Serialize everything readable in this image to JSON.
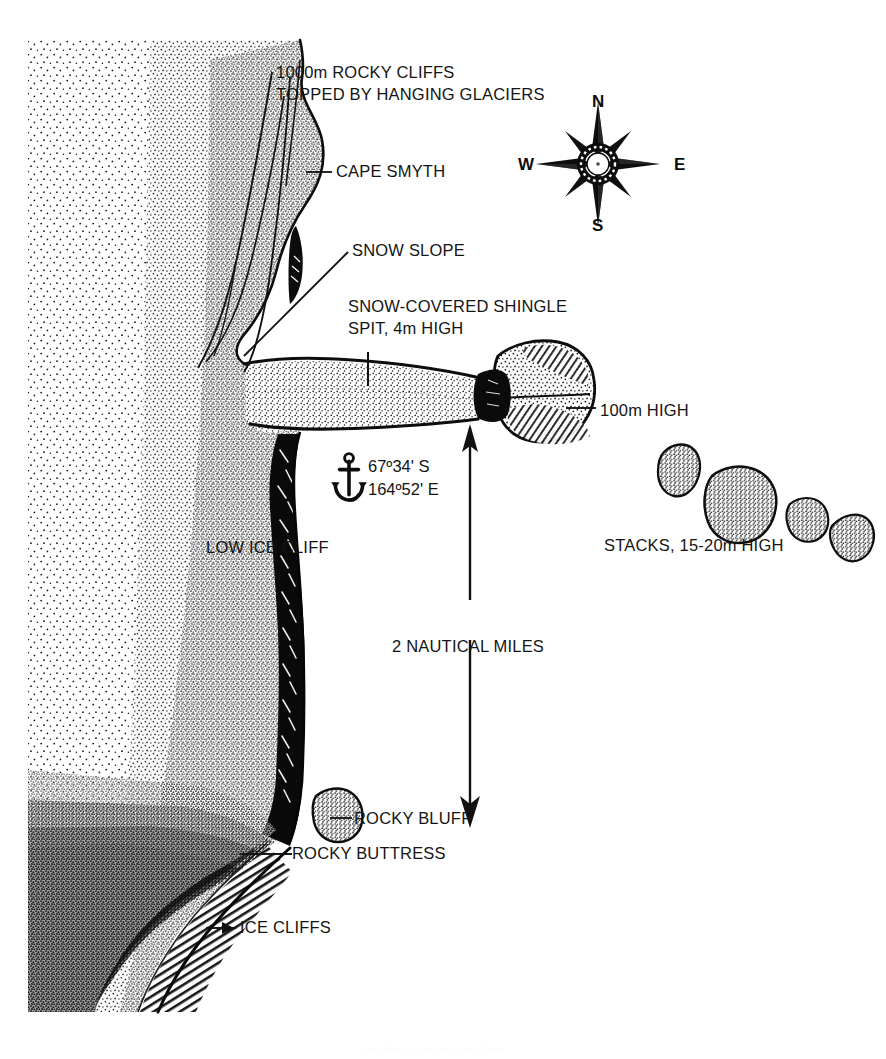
{
  "figure": {
    "type": "hand-drawn coastal profile map",
    "background_color": "#ffffff",
    "ink_color": "#111111"
  },
  "labels": {
    "cliffs_line1": "1000m ROCKY CLIFFS",
    "cliffs_line2": "TOPPED BY HANGING GLACIERS",
    "cape": "CAPE SMYTH",
    "snow_slope": "SNOW SLOPE",
    "spit_line1": "SNOW-COVERED SHINGLE",
    "spit_line2": "SPIT, 4m HIGH",
    "headland_height": "100m HIGH",
    "stacks": "STACKS, 15-20m HIGH",
    "low_ice_cliff": "LOW ICE CLIFF",
    "scale": "2 NAUTICAL MILES",
    "rocky_bluff": "ROCKY BLUFF",
    "rocky_buttress": "ROCKY BUTTRESS",
    "ice_cliffs": "ICE CLIFFS"
  },
  "anchorage": {
    "icon": "anchor-icon",
    "latitude": "67º34' S",
    "longitude": "164º52' E"
  },
  "compass": {
    "icon": "compass-rose-icon",
    "north": "N",
    "east": "E",
    "south": "S",
    "west": "W"
  },
  "watermark": {
    "text": "available to download at no charge"
  },
  "features": [
    {
      "name": "rocky-cliffs-annotation",
      "kind": "annotation"
    },
    {
      "name": "cape-smyth-headland",
      "kind": "landform"
    },
    {
      "name": "snow-slope",
      "kind": "landform"
    },
    {
      "name": "shingle-spit",
      "kind": "landform"
    },
    {
      "name": "offshore-headland",
      "kind": "landform"
    },
    {
      "name": "sea-stacks",
      "kind": "landform",
      "count": 4
    },
    {
      "name": "low-ice-cliff-band",
      "kind": "landform"
    },
    {
      "name": "rocky-bluff",
      "kind": "landform"
    },
    {
      "name": "rocky-buttress",
      "kind": "landform"
    },
    {
      "name": "ice-cliffs",
      "kind": "landform"
    },
    {
      "name": "scale-arrow",
      "kind": "scale-bar"
    }
  ]
}
